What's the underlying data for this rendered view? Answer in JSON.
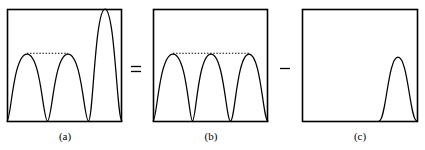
{
  "figure": {
    "type": "math-illustration",
    "background_color": "#ffffff",
    "stroke_color": "#000000",
    "panels": [
      {
        "id": "a",
        "label": "(a)",
        "box": {
          "x": 7,
          "y": 9,
          "width": 115,
          "height": 113
        },
        "curve_name": "three-humps-third-tall",
        "humps": [
          {
            "index": 1,
            "peak_x": 27,
            "peak_y": 54,
            "start_x": 7,
            "end_x": 47,
            "height_units": 1
          },
          {
            "index": 2,
            "peak_x": 68,
            "peak_y": 54,
            "start_x": 48,
            "end_x": 88,
            "height_units": 1
          },
          {
            "index": 3,
            "peak_x": 105,
            "peak_y": 8,
            "start_x": 85,
            "end_x": 122,
            "height_units": 1.7
          }
        ],
        "baseline_y": 121,
        "dotted_line": {
          "from_x": 27,
          "to_x": 68,
          "y": 53,
          "style": "dotted"
        }
      },
      {
        "id": "b",
        "label": "(b)",
        "box": {
          "x": 153,
          "y": 9,
          "width": 115,
          "height": 113
        },
        "curve_name": "three-humps-equal",
        "humps": [
          {
            "index": 1,
            "peak_x": 173,
            "peak_y": 54,
            "start_x": 153,
            "end_x": 193,
            "height_units": 1
          },
          {
            "index": 2,
            "peak_x": 211,
            "peak_y": 54,
            "start_x": 191,
            "end_x": 231,
            "height_units": 1
          },
          {
            "index": 3,
            "peak_x": 249,
            "peak_y": 54,
            "start_x": 229,
            "end_x": 268,
            "height_units": 1
          }
        ],
        "baseline_y": 121,
        "dotted_line": {
          "from_x": 173,
          "to_x": 249,
          "y": 53,
          "style": "dotted"
        }
      },
      {
        "id": "c",
        "label": "(c)",
        "box": {
          "x": 302,
          "y": 9,
          "width": 116,
          "height": 113
        },
        "curve_name": "single-hump-right",
        "humps": [
          {
            "index": 1,
            "peak_x": 398,
            "peak_y": 57,
            "start_x": 381,
            "end_x": 416,
            "height_units": 0.57
          }
        ],
        "baseline_y": 121,
        "dotted_line": null
      }
    ],
    "operators": [
      {
        "name": "equals-sign",
        "symbol": "=",
        "x": 136,
        "y": 69
      },
      {
        "name": "minus-sign",
        "symbol": "−",
        "x": 285,
        "y": 69
      }
    ]
  }
}
